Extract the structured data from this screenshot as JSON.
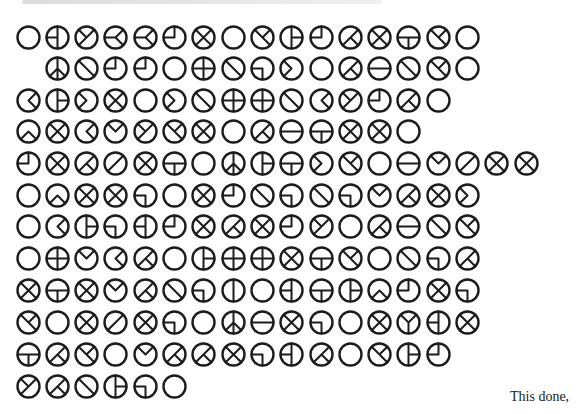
{
  "document": {
    "caption": "This done,",
    "ink_color": "#1c1c1c"
  },
  "grid": {
    "x0": 28,
    "dx": 29.3,
    "row_y": [
      37,
      68,
      100,
      131,
      163,
      195,
      226,
      258,
      290,
      322,
      354,
      386
    ],
    "rows": [
      {
        "start_col": 0,
        "glyphs": [
          "O",
          "HL",
          "Y",
          "KL",
          "KL",
          "Q",
          "X",
          "O",
          "DK",
          "PR",
          "Q",
          "AK",
          "X",
          "T",
          "DK",
          "O"
        ]
      },
      {
        "start_col": 1,
        "glyphs": [
          "PEACE",
          "D",
          "Q",
          "Q",
          "O",
          "P",
          "D",
          "G",
          "CR",
          "O",
          "AK",
          "H",
          "D",
          "DK",
          "O"
        ]
      },
      {
        "start_col": 0,
        "glyphs": [
          "CL",
          "PR",
          "CR",
          "X",
          "O",
          "CR",
          "D",
          "P",
          "P",
          "D",
          "CL",
          "Y",
          "Q",
          "AK",
          "O"
        ]
      },
      {
        "start_col": 0,
        "glyphs": [
          "CU",
          "X",
          "CL",
          "V",
          "Y",
          "DK",
          "X",
          "O",
          "AK",
          "H",
          "T",
          "X",
          "X",
          "O"
        ]
      },
      {
        "start_col": 0,
        "glyphs": [
          "Q",
          "X",
          "AK",
          "A",
          "X",
          "T",
          "O",
          "PEACE",
          "PR",
          "T",
          "CR",
          "DK",
          "O",
          "H",
          "V",
          "A",
          "X",
          "X"
        ]
      },
      {
        "start_col": 0,
        "glyphs": [
          "O",
          "CU",
          "X",
          "X",
          "G",
          "O",
          "X",
          "Q",
          "D",
          "G",
          "D",
          "G",
          "V",
          "AK",
          "X",
          "CR"
        ]
      },
      {
        "start_col": 0,
        "glyphs": [
          "O",
          "CL",
          "PR",
          "G",
          "HL",
          "Q",
          "X",
          "AK",
          "X",
          "Q",
          "Y",
          "O",
          "AK",
          "H",
          "D",
          "DK"
        ]
      },
      {
        "start_col": 0,
        "glyphs": [
          "O",
          "P",
          "V",
          "CL",
          "AK",
          "O",
          "PR",
          "P",
          "P",
          "X",
          "T",
          "DK",
          "O",
          "D",
          "G",
          "AK"
        ]
      },
      {
        "start_col": 0,
        "glyphs": [
          "X",
          "T",
          "X",
          "V",
          "AK",
          "D",
          "G",
          "VL",
          "O",
          "HL",
          "T",
          "PR",
          "CU",
          "Q",
          "X",
          "G"
        ]
      },
      {
        "start_col": 0,
        "glyphs": [
          "DK",
          "O",
          "X",
          "A",
          "X",
          "G",
          "O",
          "PEACE",
          "H",
          "X",
          "G",
          "O",
          "X",
          "YU",
          "HL",
          "X"
        ]
      },
      {
        "start_col": 0,
        "glyphs": [
          "T",
          "AK",
          "DK",
          "O",
          "V",
          "AK",
          "AK",
          "X",
          "G",
          "HL",
          "AK",
          "O",
          "DK",
          "PR",
          "Q"
        ]
      },
      {
        "start_col": 0,
        "glyphs": [
          "Y",
          "AK",
          "D",
          "PR",
          "G",
          "O"
        ]
      }
    ]
  }
}
